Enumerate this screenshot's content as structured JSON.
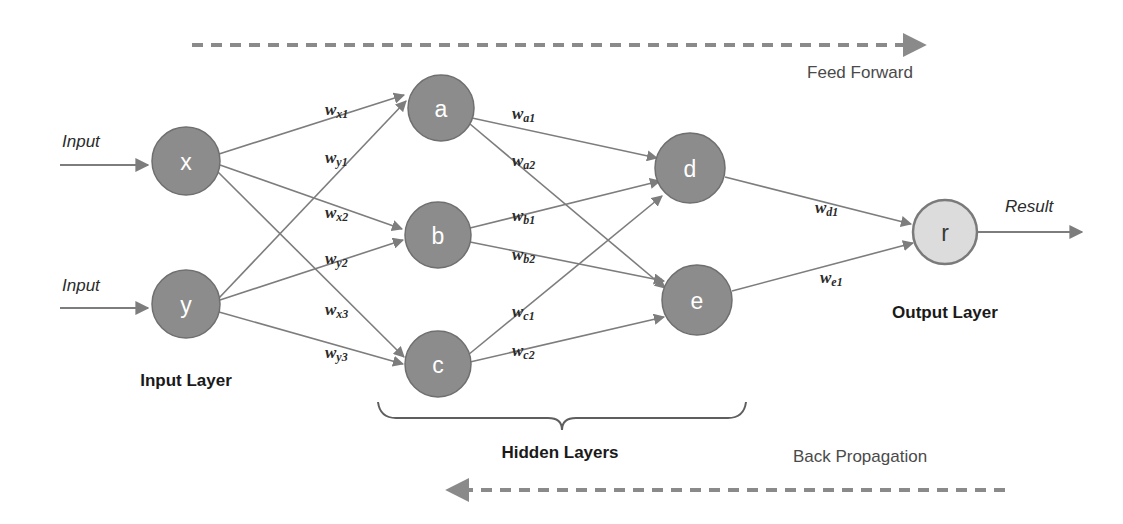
{
  "diagram": {
    "colors": {
      "node_fill": "#8c8c8c",
      "node_stroke": "#6f6f6f",
      "output_node_fill": "#dcdcdc",
      "output_node_stroke": "#7a7a7a",
      "edge": "#7d7d7d",
      "dashed_arrow": "#8a8a8a",
      "text_dark": "#1a1a1a",
      "text_gray": "#4a4a4a",
      "background": "#ffffff"
    },
    "nodes": [
      {
        "id": "x",
        "label": "x",
        "layer": "input",
        "cx": 186,
        "cy": 161,
        "r": 34,
        "style": "filled"
      },
      {
        "id": "y",
        "label": "y",
        "layer": "input",
        "cx": 186,
        "cy": 304,
        "r": 34,
        "style": "filled"
      },
      {
        "id": "a",
        "label": "a",
        "layer": "hidden1",
        "cx": 441,
        "cy": 108,
        "r": 33,
        "style": "filled"
      },
      {
        "id": "b",
        "label": "b",
        "layer": "hidden1",
        "cx": 438,
        "cy": 235,
        "r": 33,
        "style": "filled"
      },
      {
        "id": "c",
        "label": "c",
        "layer": "hidden1",
        "cx": 438,
        "cy": 364,
        "r": 33,
        "style": "filled"
      },
      {
        "id": "d",
        "label": "d",
        "layer": "hidden2",
        "cx": 690,
        "cy": 168,
        "r": 35,
        "style": "filled"
      },
      {
        "id": "e",
        "label": "e",
        "layer": "hidden2",
        "cx": 697,
        "cy": 300,
        "r": 35,
        "style": "filled"
      },
      {
        "id": "r",
        "label": "r",
        "layer": "output",
        "cx": 945,
        "cy": 232,
        "r": 32,
        "style": "light"
      }
    ],
    "edges": [
      {
        "from": "x",
        "to": "a",
        "weight": "w",
        "sub": "x1",
        "label_x": 325,
        "label_y": 109
      },
      {
        "from": "y",
        "to": "a",
        "weight": "w",
        "sub": "y1",
        "label_x": 325,
        "label_y": 157
      },
      {
        "from": "x",
        "to": "b",
        "weight": "w",
        "sub": "x2",
        "label_x": 325,
        "label_y": 212
      },
      {
        "from": "y",
        "to": "b",
        "weight": "w",
        "sub": "y2",
        "label_x": 325,
        "label_y": 258
      },
      {
        "from": "x",
        "to": "c",
        "weight": "w",
        "sub": "x3",
        "label_x": 325,
        "label_y": 309
      },
      {
        "from": "y",
        "to": "c",
        "weight": "w",
        "sub": "y3",
        "label_x": 325,
        "label_y": 352
      },
      {
        "from": "a",
        "to": "d",
        "weight": "w",
        "sub": "a1",
        "label_x": 512,
        "label_y": 113
      },
      {
        "from": "a",
        "to": "e",
        "weight": "w",
        "sub": "a2",
        "label_x": 512,
        "label_y": 160
      },
      {
        "from": "b",
        "to": "d",
        "weight": "w",
        "sub": "b1",
        "label_x": 512,
        "label_y": 215
      },
      {
        "from": "b",
        "to": "e",
        "weight": "w",
        "sub": "b2",
        "label_x": 512,
        "label_y": 254
      },
      {
        "from": "c",
        "to": "d",
        "weight": "w",
        "sub": "c1",
        "label_x": 512,
        "label_y": 311
      },
      {
        "from": "c",
        "to": "e",
        "weight": "w",
        "sub": "c2",
        "label_x": 512,
        "label_y": 350
      },
      {
        "from": "d",
        "to": "r",
        "weight": "w",
        "sub": "d1",
        "label_x": 815,
        "label_y": 207
      },
      {
        "from": "e",
        "to": "r",
        "weight": "w",
        "sub": "e1",
        "label_x": 820,
        "label_y": 277
      }
    ],
    "io_labels": [
      {
        "id": "input-top",
        "text": "Input",
        "x": 62,
        "y": 141
      },
      {
        "id": "input-bottom",
        "text": "Input",
        "x": 62,
        "y": 285
      },
      {
        "id": "result",
        "text": "Result",
        "x": 1005,
        "y": 206
      }
    ],
    "layer_labels": [
      {
        "id": "input-layer",
        "text": "Input Layer",
        "x": 186,
        "y": 380
      },
      {
        "id": "hidden-layers",
        "text": "Hidden Layers",
        "x": 560,
        "y": 452
      },
      {
        "id": "output-layer",
        "text": "Output Layer",
        "x": 945,
        "y": 312
      }
    ],
    "flow_arrows": [
      {
        "id": "feed-forward",
        "label": "Feed Forward",
        "direction": "right",
        "label_x": 860,
        "label_y": 72,
        "line_y": 45,
        "x_start": 192,
        "x_end": 930
      },
      {
        "id": "back-propagation",
        "label": "Back Propagation",
        "direction": "left",
        "label_x": 860,
        "label_y": 456,
        "line_y": 490,
        "x_start": 1005,
        "x_end": 442
      }
    ],
    "brace": {
      "id": "hidden-layers-brace",
      "x_start": 378,
      "x_end": 745,
      "y": 415,
      "tip_x": 562
    }
  }
}
